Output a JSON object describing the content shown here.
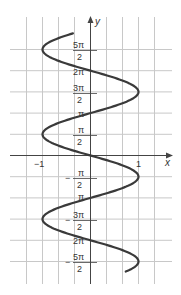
{
  "chart_data": {
    "type": "line",
    "title": "",
    "equation": "x = -sin(y)",
    "xlabel": "x",
    "ylabel": "y",
    "xlim": [
      -1.75,
      1.75
    ],
    "ylim": [
      "-5π/2 - 0.8",
      "5π/2 + 0.8"
    ],
    "grid": true,
    "x_ticks": [
      {
        "value": -1,
        "label": "−1"
      },
      {
        "value": 1,
        "label": "1"
      }
    ],
    "y_ticks": [
      {
        "value": 7.854,
        "label_num": "5π",
        "label_den": "2",
        "minus": ""
      },
      {
        "value": 6.283,
        "label": "2π"
      },
      {
        "value": 4.712,
        "label_num": "3π",
        "label_den": "2",
        "minus": ""
      },
      {
        "value": 3.1416,
        "label": "π"
      },
      {
        "value": 1.5708,
        "label_num": "π",
        "label_den": "2",
        "minus": ""
      },
      {
        "value": -1.5708,
        "label_num": "π",
        "label_den": "2",
        "minus": "−"
      },
      {
        "value": -3.1416,
        "label": "π"
      },
      {
        "value": -4.712,
        "label_num": "3π",
        "label_den": "2",
        "minus": "−"
      },
      {
        "value": -6.283,
        "label": "2π"
      },
      {
        "value": -7.854,
        "label_num": "5π",
        "label_den": "2",
        "minus": "−"
      }
    ],
    "series": [
      {
        "name": "x = -sin(y)",
        "y_range": [
          -8.6,
          9.05
        ],
        "points": [
          {
            "y": 7.854,
            "x": -1
          },
          {
            "y": 6.283,
            "x": 0
          },
          {
            "y": 4.712,
            "x": 1
          },
          {
            "y": 3.1416,
            "x": 0
          },
          {
            "y": 1.5708,
            "x": -1
          },
          {
            "y": 0,
            "x": 0
          },
          {
            "y": -1.5708,
            "x": 1
          },
          {
            "y": -3.1416,
            "x": 0
          },
          {
            "y": -4.712,
            "x": -1
          },
          {
            "y": -6.283,
            "x": 0
          },
          {
            "y": -7.854,
            "x": 1
          }
        ]
      }
    ]
  },
  "labels": {
    "x_axis": "x",
    "y_axis": "y",
    "x_neg1": "−1",
    "x_pos1": "1",
    "five_pi": "5π",
    "three_pi": "3π",
    "pi": "π",
    "two_pi": "2π",
    "two": "2",
    "minus": "−"
  },
  "colors": {
    "curve": "#3a3a3a",
    "grid": "#c8c8c8",
    "axis": "#444444"
  }
}
